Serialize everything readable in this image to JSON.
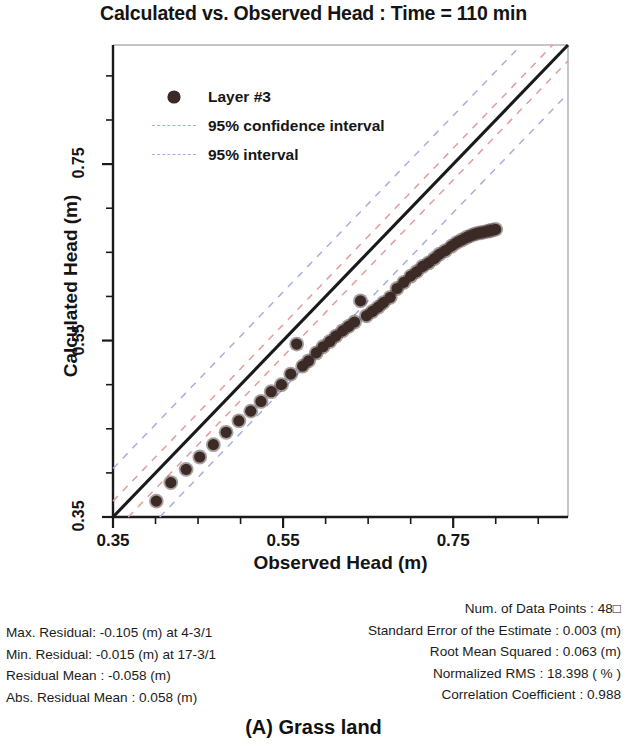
{
  "chart_data": {
    "type": "scatter",
    "title": "Calculated vs. Observed Head : Time = 110 min",
    "xlabel": "Observed Head (m)",
    "ylabel": "Calculated Head (m)",
    "xlim": [
      0.35,
      0.885
    ],
    "ylim": [
      0.35,
      0.885
    ],
    "xticks": [
      0.35,
      0.55,
      0.75
    ],
    "xtick_labels": [
      "0.35",
      "0.55",
      "0.75"
    ],
    "yticks": [
      0.35,
      0.55,
      0.75
    ],
    "ytick_labels": [
      "0.35",
      "0.55",
      "0.75"
    ],
    "minor_tick_step": 0.05,
    "grid": false,
    "legend_position": "upper-left",
    "legend": [
      {
        "label": "Layer #3",
        "kind": "marker",
        "color": "#3b2a26"
      },
      {
        "label": "95% confidence interval",
        "kind": "dashed-line",
        "color": "#e59b9b"
      },
      {
        "label": "95% interval",
        "kind": "dashed-line",
        "color": "#a8aee0"
      }
    ],
    "reference_line": {
      "label": "1:1 line",
      "slope": 1,
      "intercept": 0,
      "color": "#1a1a1a"
    },
    "confidence_band_offset": 0.018,
    "prediction_band_offset": 0.055,
    "series": [
      {
        "name": "Layer #3",
        "color": "#3b2a26",
        "x": [
          0.401,
          0.418,
          0.436,
          0.452,
          0.468,
          0.483,
          0.498,
          0.512,
          0.524,
          0.536,
          0.548,
          0.559,
          0.566,
          0.573,
          0.58,
          0.589,
          0.597,
          0.605,
          0.612,
          0.62,
          0.627,
          0.634,
          0.641,
          0.648,
          0.655,
          0.662,
          0.668,
          0.676,
          0.684,
          0.692,
          0.7,
          0.707,
          0.714,
          0.721,
          0.728,
          0.734,
          0.741,
          0.748,
          0.754,
          0.76,
          0.766,
          0.771,
          0.776,
          0.781,
          0.786,
          0.791,
          0.795,
          0.8
        ],
        "y": [
          0.368,
          0.389,
          0.404,
          0.418,
          0.432,
          0.446,
          0.459,
          0.47,
          0.481,
          0.492,
          0.5,
          0.512,
          0.546,
          0.521,
          0.527,
          0.536,
          0.543,
          0.549,
          0.555,
          0.561,
          0.566,
          0.571,
          0.595,
          0.578,
          0.583,
          0.588,
          0.593,
          0.599,
          0.609,
          0.616,
          0.623,
          0.628,
          0.634,
          0.638,
          0.643,
          0.648,
          0.652,
          0.657,
          0.661,
          0.664,
          0.667,
          0.669,
          0.671,
          0.672,
          0.673,
          0.674,
          0.675,
          0.676
        ]
      }
    ]
  },
  "stats_left": [
    "Max. Residual: -0.105 (m) at 4-3/1",
    "Min. Residual: -0.015 (m) at 17-3/1",
    "Residual Mean : -0.058 (m)",
    "Abs. Residual Mean : 0.058 (m)"
  ],
  "stats_right": [
    "Num. of Data Points : 48□",
    "Standard Error of the Estimate : 0.003 (m)",
    "Root Mean Squared : 0.063 (m)",
    "Normalized RMS : 18.398 ( % )",
    "Correlation Coefficient : 0.988"
  ],
  "caption": "(A) Grass land"
}
